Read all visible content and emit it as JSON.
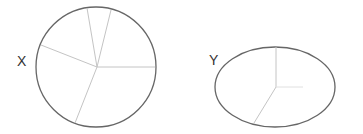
{
  "diagram": {
    "shapes": [
      {
        "id": "X",
        "label": "X",
        "type": "circle",
        "stroke_color": "#666666",
        "divider_color": "#c4c4c4",
        "sector_count": 5
      },
      {
        "id": "Y",
        "label": "Y",
        "type": "ellipse",
        "stroke_color": "#666666",
        "divider_color": "#c4c4c4",
        "sector_count": 3
      }
    ]
  }
}
